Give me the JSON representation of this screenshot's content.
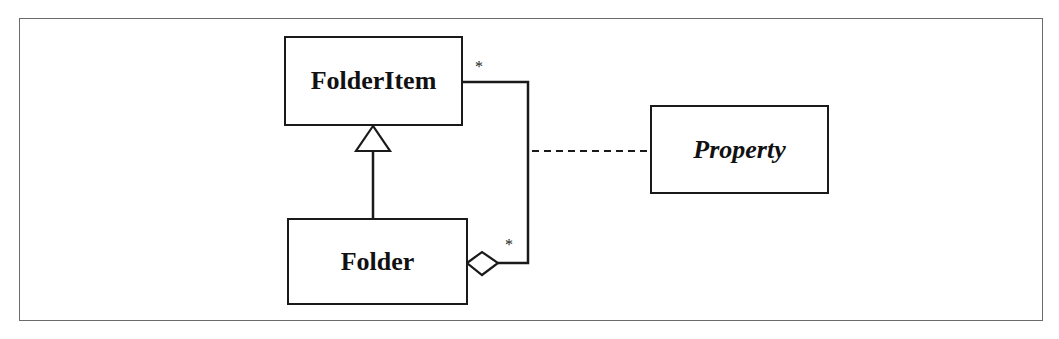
{
  "diagram": {
    "type": "UML class diagram",
    "classes": [
      {
        "id": "folderitem",
        "name": "FolderItem",
        "abstract": false
      },
      {
        "id": "folder",
        "name": "Folder",
        "abstract": false
      },
      {
        "id": "property",
        "name": "Property",
        "abstract": true
      }
    ],
    "relationships": [
      {
        "type": "generalization",
        "from": "Folder",
        "to": "FolderItem"
      },
      {
        "type": "aggregation",
        "whole": "Folder",
        "part": "FolderItem",
        "whole_multiplicity": "*",
        "part_multiplicity": "*"
      },
      {
        "type": "association-class",
        "association": "Folder-FolderItem aggregation",
        "class": "Property"
      }
    ],
    "multiplicities": {
      "folderitem_end": "*",
      "folder_end": "*"
    }
  }
}
